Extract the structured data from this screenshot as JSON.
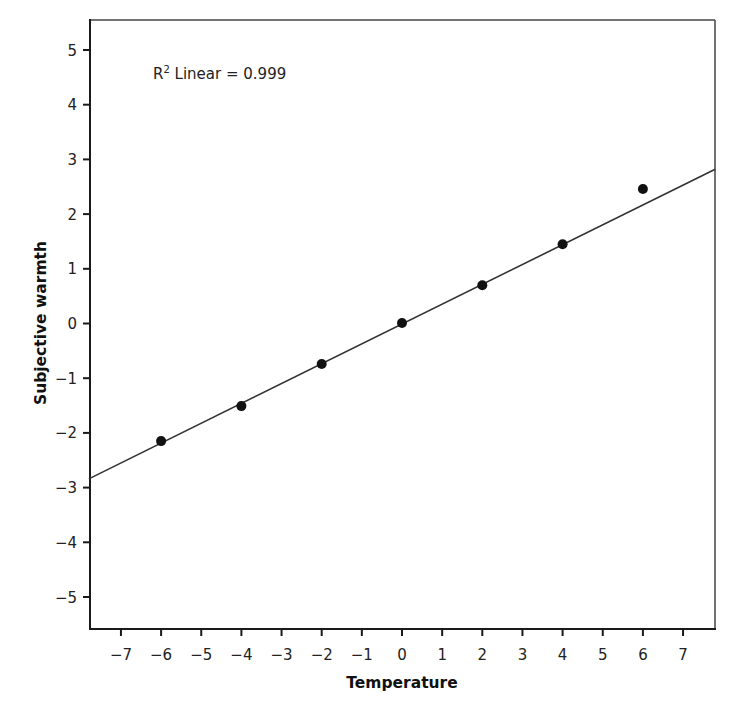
{
  "chart_data": {
    "type": "scatter",
    "title": "",
    "xlabel": "Temperature",
    "ylabel": "Subjective warmth",
    "xlim": [
      -7.8,
      7.8
    ],
    "ylim": [
      -5.55,
      5.55
    ],
    "grid": false,
    "legend": null,
    "x_ticks": [
      -7,
      -6,
      -5,
      -4,
      -3,
      -2,
      -1,
      0,
      1,
      2,
      3,
      4,
      5,
      6,
      7
    ],
    "x_tick_labels": [
      "−7",
      "−6",
      "−5",
      "−4",
      "−3",
      "−2",
      "−1",
      "0",
      "1",
      "2",
      "3",
      "4",
      "5",
      "6",
      "7"
    ],
    "y_ticks": [
      5,
      4,
      3,
      2,
      1,
      0,
      -1,
      -2,
      -3,
      -4,
      -5
    ],
    "y_tick_labels": [
      "5",
      "4",
      "3",
      "2",
      "1",
      "0",
      "−1",
      "−2",
      "−3",
      "−4",
      "−5"
    ],
    "series": [
      {
        "name": "Observed",
        "type": "scatter",
        "x": [
          -6,
          -4,
          -2,
          0,
          2,
          4,
          6
        ],
        "y": [
          -2.15,
          -1.51,
          -0.74,
          0.01,
          0.7,
          1.45,
          2.46
        ]
      },
      {
        "name": "Linear fit",
        "type": "line",
        "x": [
          -7.8,
          7.8
        ],
        "y": [
          -2.84,
          2.82
        ]
      }
    ],
    "annotations": [
      {
        "text": "R² Linear = 0.999",
        "x": -6.2,
        "y": 4.65
      }
    ]
  },
  "labels": {
    "x_axis_title": "Temperature",
    "y_axis_title": "Subjective warmth",
    "r2_prefix": "R",
    "r2_superscript": "2",
    "r2_text": " Linear = 0.999"
  },
  "colors": {
    "axis": "#1a1a1a",
    "point": "#111111",
    "line": "#333333",
    "background": "#ffffff"
  }
}
